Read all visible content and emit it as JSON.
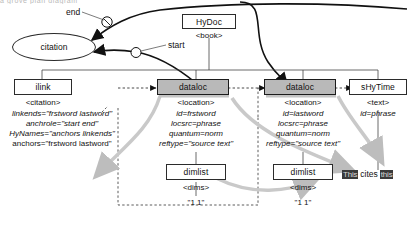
{
  "diagram": {
    "title_clipped": "a grove plan diagram",
    "nodes": {
      "citation": {
        "label": "citation",
        "shape": "ellipse"
      },
      "hydoc": {
        "label": "HyDoc",
        "type": "<book>"
      },
      "ilink": {
        "label": "ilink",
        "type": "<citation>"
      },
      "dataloc1": {
        "label": "dataloc",
        "type": "<location>"
      },
      "dataloc2": {
        "label": "dataloc",
        "type": "<location>"
      },
      "shytime": {
        "label": "sHyTime",
        "type": "<text>"
      },
      "dimlist1": {
        "label": "dimlist",
        "type": "<dims>"
      },
      "dimlist2": {
        "label": "dimlist",
        "type": "<dims>"
      }
    },
    "attributes": {
      "ilink": [
        "linkends=\"frstword lastword\"",
        "anchrole=\"start end\"",
        "HyNames=\"anchors linkends\"",
        "anchors=\"frstword lastword\""
      ],
      "dataloc1": [
        "id=frstword",
        "locsrc=phrase",
        "quantum=norm",
        "reftype=\"source text\""
      ],
      "dataloc2": [
        "id=lastword",
        "locsrc=phrase",
        "quantum=norm",
        "reftype=\"source text\""
      ],
      "shytime": [
        "id=phrase"
      ]
    },
    "values": {
      "dimlist1": "\"1 1\"",
      "dimlist2": "\"1 1\""
    },
    "edge_labels": {
      "end": "end",
      "start": "start"
    },
    "text_sample": {
      "word_before": "This",
      "middle": "cites",
      "word_after": "this"
    },
    "colors": {
      "node_fill": "#ffffff",
      "highlight_fill": "#b9b9b9",
      "stroke": "#2b2b2b",
      "shadow": "#c4c4c4",
      "inverse_text_bg": "#3a3a3a"
    }
  }
}
